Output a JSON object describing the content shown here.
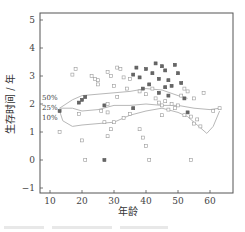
{
  "chart_data": {
    "type": "scatter",
    "title": "",
    "xlabel": "年龄",
    "ylabel": "生存时间 / 年",
    "xlim": [
      7,
      67
    ],
    "ylim": [
      -1.2,
      5.25
    ],
    "xticks": [
      10,
      20,
      30,
      40,
      50,
      60
    ],
    "yticks": [
      -1,
      0,
      1,
      2,
      3,
      4,
      5
    ],
    "grid": false,
    "legend": "none",
    "series": [
      {
        "name": "filled",
        "marker": "filled-square",
        "points": [
          [
            13,
            1.75
          ],
          [
            19,
            2.05
          ],
          [
            20,
            2.15
          ],
          [
            21,
            2.25
          ],
          [
            27,
            1.95
          ],
          [
            27,
            0.0
          ],
          [
            36,
            1.85
          ],
          [
            36,
            3.05
          ],
          [
            37,
            3.3
          ],
          [
            38,
            2.95
          ],
          [
            40,
            3.25
          ],
          [
            42,
            3.1
          ],
          [
            43,
            3.45
          ],
          [
            44,
            2.9
          ],
          [
            45,
            3.35
          ],
          [
            46,
            3.2
          ],
          [
            47,
            2.85
          ],
          [
            48,
            2.65
          ],
          [
            49,
            3.4
          ],
          [
            50,
            3.1
          ],
          [
            51,
            2.75
          ],
          [
            52,
            2.2
          ],
          [
            53,
            1.7
          ],
          [
            44,
            2.4
          ],
          [
            47,
            2.3
          ],
          [
            46,
            2.6
          ],
          [
            41,
            2.7
          ],
          [
            39,
            2.55
          ]
        ]
      },
      {
        "name": "open",
        "marker": "open-square",
        "points": [
          [
            17,
            3.05
          ],
          [
            18,
            3.25
          ],
          [
            23,
            3.0
          ],
          [
            24,
            2.9
          ],
          [
            25,
            2.85
          ],
          [
            25,
            2.7
          ],
          [
            28,
            3.15
          ],
          [
            29,
            3.0
          ],
          [
            30,
            2.65
          ],
          [
            31,
            3.3
          ],
          [
            32,
            3.25
          ],
          [
            33,
            2.95
          ],
          [
            34,
            2.55
          ],
          [
            35,
            2.9
          ],
          [
            38,
            2.45
          ],
          [
            40,
            2.35
          ],
          [
            42,
            2.55
          ],
          [
            43,
            2.2
          ],
          [
            44,
            2.05
          ],
          [
            45,
            1.95
          ],
          [
            46,
            2.1
          ],
          [
            48,
            2.0
          ],
          [
            49,
            1.85
          ],
          [
            50,
            1.95
          ],
          [
            51,
            2.3
          ],
          [
            52,
            1.6
          ],
          [
            54,
            1.55
          ],
          [
            55,
            2.2
          ],
          [
            56,
            1.45
          ],
          [
            57,
            1.2
          ],
          [
            58,
            2.4
          ],
          [
            61,
            1.75
          ],
          [
            63,
            1.85
          ],
          [
            13,
            1.0
          ],
          [
            20,
            0.7
          ],
          [
            21,
            0.0
          ],
          [
            27,
            1.35
          ],
          [
            28,
            1.7
          ],
          [
            28,
            0.85
          ],
          [
            29,
            1.1
          ],
          [
            30,
            1.35
          ],
          [
            31,
            2.25
          ],
          [
            33,
            1.5
          ],
          [
            35,
            1.65
          ],
          [
            38,
            1.1
          ],
          [
            39,
            0.8
          ],
          [
            40,
            0.5
          ],
          [
            41,
            0.0
          ],
          [
            45,
            1.6
          ],
          [
            47,
            1.8
          ],
          [
            52,
            2.55
          ],
          [
            54,
            0.0
          ],
          [
            55,
            1.3
          ],
          [
            53,
            2.45
          ],
          [
            19,
            1.65
          ],
          [
            28,
            2.0
          ],
          [
            26,
            1.75
          ]
        ]
      }
    ],
    "curves": [
      {
        "name": "50%",
        "points": [
          [
            13,
            1.85
          ],
          [
            17,
            2.15
          ],
          [
            20,
            2.3
          ],
          [
            25,
            2.35
          ],
          [
            30,
            2.4
          ],
          [
            35,
            2.45
          ],
          [
            40,
            2.55
          ],
          [
            45,
            2.5
          ],
          [
            50,
            2.3
          ],
          [
            53,
            2.2
          ]
        ]
      },
      {
        "name": "25%",
        "points": [
          [
            13,
            1.85
          ],
          [
            17,
            1.85
          ],
          [
            20,
            1.75
          ],
          [
            25,
            1.8
          ],
          [
            30,
            1.95
          ],
          [
            35,
            1.95
          ],
          [
            40,
            2.0
          ],
          [
            45,
            1.95
          ],
          [
            50,
            1.95
          ],
          [
            55,
            1.85
          ],
          [
            60,
            1.8
          ],
          [
            63,
            1.85
          ]
        ]
      },
      {
        "name": "10%",
        "points": [
          [
            13,
            1.75
          ],
          [
            14,
            1.4
          ],
          [
            17,
            1.2
          ],
          [
            20,
            1.25
          ],
          [
            25,
            1.3
          ],
          [
            30,
            1.35
          ],
          [
            35,
            1.6
          ],
          [
            40,
            1.75
          ],
          [
            45,
            1.85
          ],
          [
            50,
            1.7
          ],
          [
            53,
            1.55
          ],
          [
            56,
            1.25
          ],
          [
            59,
            0.95
          ],
          [
            61,
            1.2
          ],
          [
            63,
            1.75
          ]
        ]
      }
    ],
    "curve_labels": [
      "50%",
      "25%",
      "10%"
    ]
  },
  "caption": ""
}
